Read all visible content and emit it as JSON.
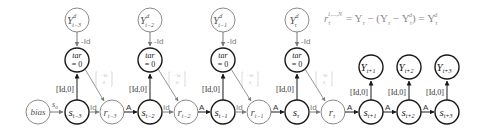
{
  "colors": {
    "dark": "#1a1a1a",
    "gray": "#8a8a8a",
    "light": "#c4c4c4",
    "edge_label": "#555555"
  },
  "equation": {
    "lhs": "r",
    "lhs_sub": "τ",
    "lhs_sup": "1,...,N",
    "rhs": "= Y",
    "rhs_sub1": "τ",
    "mid": " − (Y",
    "mid_sub": "τ",
    "minus": " − Y",
    "minus_sub": "τ",
    "minus_sup": "d",
    "close": ") = Y",
    "final_sub": "τ",
    "final_sup": "d"
  },
  "nodes": {
    "bias": {
      "label": "bias"
    },
    "y_d": [
      {
        "main": "Y",
        "sup": "d",
        "sub": "t−3"
      },
      {
        "main": "Y",
        "sup": "d",
        "sub": "t−2"
      },
      {
        "main": "Y",
        "sup": "d",
        "sub": "t−1"
      },
      {
        "main": "Y",
        "sup": "d",
        "sub": "τ"
      }
    ],
    "tar": [
      {
        "line1": "tar",
        "line2": "= 0"
      },
      {
        "line1": "tar",
        "line2": "= 0"
      },
      {
        "line1": "tar",
        "line2": "= 0"
      },
      {
        "line1": "tar",
        "line2": "= 0"
      }
    ],
    "s": [
      {
        "main": "s",
        "sub": "t−3"
      },
      {
        "main": "s",
        "sub": "t−2"
      },
      {
        "main": "s",
        "sub": "t−1"
      },
      {
        "main": "s",
        "sub": "τ"
      },
      {
        "main": "s",
        "sub": "t+1"
      },
      {
        "main": "s",
        "sub": "t+2"
      },
      {
        "main": "s",
        "sub": "t+3"
      }
    ],
    "r": [
      {
        "main": "r",
        "sub": "t−3"
      },
      {
        "main": "r",
        "sub": "t−2"
      },
      {
        "main": "r",
        "sub": "t−1"
      },
      {
        "main": "r",
        "sub": "τ"
      }
    ],
    "y_out": [
      {
        "main": "Y",
        "sub": "t+1"
      },
      {
        "main": "Y",
        "sub": "t+2"
      },
      {
        "main": "Y",
        "sub": "t+3"
      }
    ]
  },
  "edge_labels": {
    "bias_to_s": "s",
    "bias_to_s_sub": "0",
    "neg_id": "-Id",
    "id": "Id",
    "a": "A",
    "id_zero": "[Id,0]",
    "matrix_top": "−Id",
    "matrix_bottom": "0"
  }
}
